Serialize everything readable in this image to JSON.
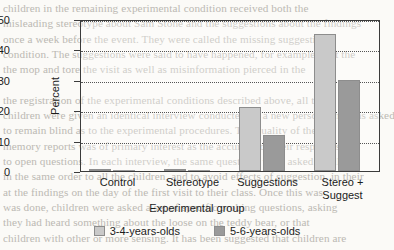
{
  "chart_data": {
    "type": "bar",
    "title": "",
    "xlabel": "Experimental group",
    "ylabel": "Percent",
    "categories": [
      "Control",
      "Stereotype",
      "Suggestions",
      "Stereo +\nSuggest"
    ],
    "category_lines": [
      [
        "Control"
      ],
      [
        "Stereotype"
      ],
      [
        "Suggestions"
      ],
      [
        "Stereo +",
        "Suggest"
      ]
    ],
    "series": [
      {
        "name": "3-4-years-olds",
        "values": [
          0.5,
          0.5,
          21,
          45
        ],
        "color": "#c9c9c9"
      },
      {
        "name": "5-6-years-olds",
        "values": [
          0,
          0,
          12,
          30
        ],
        "color": "#9a9a9a"
      }
    ],
    "ylim": [
      0,
      50
    ],
    "yticks": [
      0,
      10,
      20,
      30,
      40,
      50
    ],
    "ytick_labels": [
      "0",
      "10",
      "20",
      "30",
      "40",
      "50"
    ],
    "grid": true,
    "grid_style": "dotted-horizontal",
    "legend_position": "bottom-center"
  },
  "legend": {
    "items": [
      {
        "label": "3-4-years-olds"
      },
      {
        "label": "5-6-years-olds"
      }
    ]
  },
  "background_text": {
    "lines": [
      "children in the remaining experimental condition received both the",
      "misleading stereotype about Sam Stone and the suggestions about the findings",
      "once a week before the event. They were called the missing suggestions",
      "condition. The suggestions were said to have happened, for example, that the",
      "the mop and tore the visit as well as misinformation pierced in the",
      "",
      "the registration of the experimental conditions described above, all the",
      "children were given an identical interview conducted by a new person who was asked",
      "to remain blind as to the experimental procedures. The quality of their",
      "memory reports was of primary interest as the accuracy of their responses",
      "to open questions. In each interview, the same questions were asked of all",
      "in the same order to all the children, and to avoid effects of suggestion, in their",
      "at the findings on the day of the first visit to their class. Once this was",
      "was done, children were asked a set of specific probing questions, asking",
      "they had heard something about the loose on the teddy bear, or that",
      "children with other or more sensing. It has been suggested that children are"
    ]
  }
}
